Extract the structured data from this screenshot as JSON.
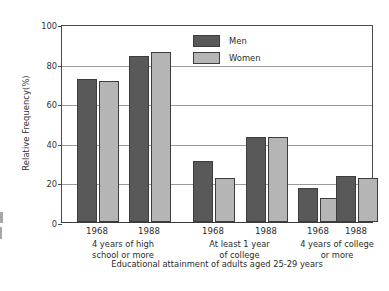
{
  "chart_data": {
    "type": "bar",
    "title": "",
    "xlabel": "Educational attainment of adults aged 25-29 years",
    "ylabel": "Relative Frequency(%)",
    "ylim": [
      0,
      100
    ],
    "yticks": [
      0,
      20,
      40,
      60,
      80,
      100
    ],
    "grid": true,
    "legend_position": "top-center",
    "categories": [
      "1968",
      "1988",
      "1968",
      "1988",
      "1968",
      "1988"
    ],
    "groups": [
      {
        "caption_line1": "4 years of high",
        "caption_line2": "school or more",
        "years": [
          "1968",
          "1988"
        ]
      },
      {
        "caption_line1": "At least 1 year",
        "caption_line2": "of college",
        "years": [
          "1968",
          "1988"
        ]
      },
      {
        "caption_line1": "4 years of college",
        "caption_line2": "or more",
        "years": [
          "1968",
          "1988"
        ]
      }
    ],
    "series": [
      {
        "name": "Men",
        "color": "#595959",
        "values": [
          72,
          84,
          31,
          43,
          17,
          23
        ]
      },
      {
        "name": "Women",
        "color": "#b5b5b5",
        "values": [
          71,
          86,
          22,
          43,
          12,
          22
        ]
      }
    ]
  },
  "legend": {
    "items": [
      {
        "label": "Men",
        "color": "#595959"
      },
      {
        "label": "Women",
        "color": "#b5b5b5"
      }
    ]
  }
}
